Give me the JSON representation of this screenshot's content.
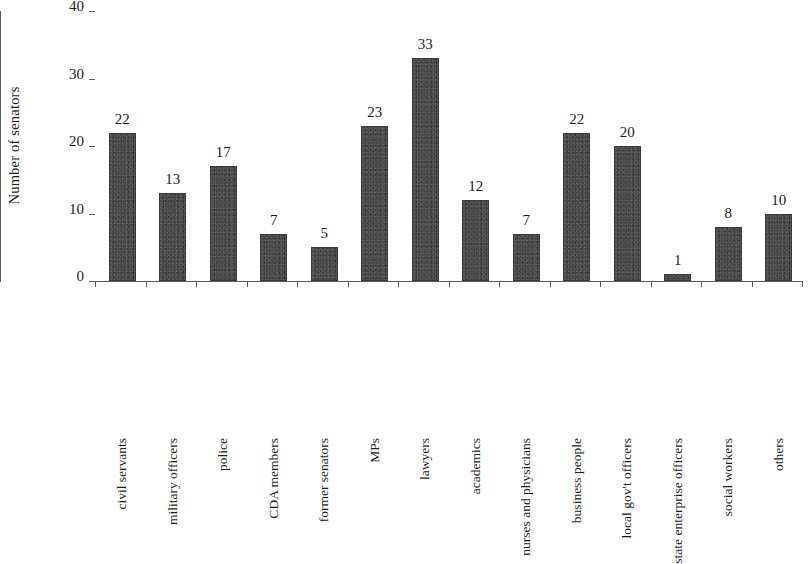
{
  "chart_data": {
    "type": "bar",
    "title": "",
    "subtitle": "",
    "xlabel": "",
    "ylabel": "Number of senators",
    "ylim": [
      0,
      40
    ],
    "yticks": [
      0,
      10,
      20,
      30,
      40
    ],
    "grid": false,
    "legend": null,
    "orientation": "vertical",
    "bar_color": "#4a4a4a",
    "axis_color": "#5d5d5d",
    "value_labels_shown": true,
    "categories": [
      "civil servants",
      "military officers",
      "police",
      "CDA members",
      "former senators",
      "MPs",
      "lawyers",
      "academics",
      "nurses and physicians",
      "business people",
      "local gov't officers",
      "state enterprise officers",
      "social workers",
      "others"
    ],
    "values": [
      22,
      13,
      17,
      7,
      5,
      23,
      33,
      12,
      7,
      22,
      20,
      1,
      8,
      10
    ]
  }
}
